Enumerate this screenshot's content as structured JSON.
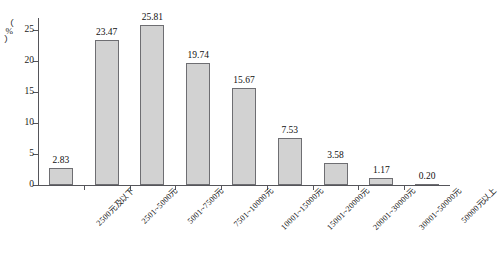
{
  "chart_data": {
    "type": "bar",
    "title": "",
    "subtitle": "",
    "xlabel": "",
    "ylabel": "（%）",
    "ylim": [
      0,
      27
    ],
    "yticks": [
      0,
      5,
      10,
      15,
      20,
      25
    ],
    "grid": false,
    "legend": null,
    "orientation": "vertical",
    "categories": [
      "2500元及以下",
      "2501~5000元",
      "5001~7500元",
      "7501~10000元",
      "10001~15000元",
      "15001~20000元",
      "20001~30000元",
      "30001~50000元",
      "50000元以上"
    ],
    "values": [
      2.83,
      23.47,
      25.81,
      19.74,
      15.67,
      7.53,
      3.58,
      1.17,
      0.2
    ],
    "value_labels": [
      "2.83",
      "23.47",
      "25.81",
      "19.74",
      "15.67",
      "7.53",
      "3.58",
      "1.17",
      "0.20"
    ],
    "bar_fill": "#d2d2d2",
    "bar_stroke": "#6e6e72",
    "axis_color": "#55555a",
    "text_color": "#101010"
  },
  "axis": {
    "y_title_chars": [
      "（",
      "%",
      "）"
    ],
    "y_tick_labels": [
      "0",
      "5",
      "10",
      "15",
      "20",
      "25"
    ]
  }
}
